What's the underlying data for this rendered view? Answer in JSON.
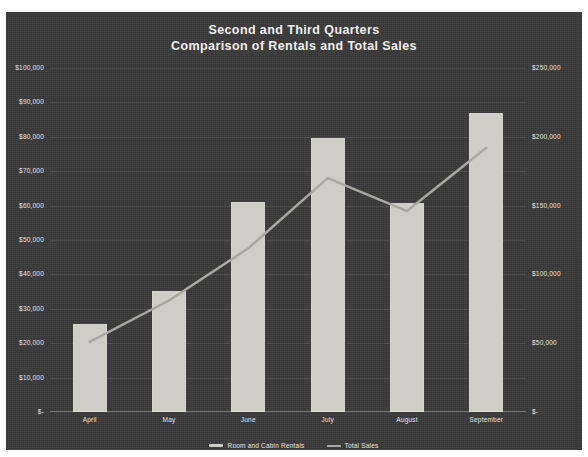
{
  "chart_data": {
    "type": "bar",
    "title": "Second and Third Quarters\nComparison of Rentals and Total Sales",
    "title_line1": "Second and Third Quarters",
    "title_line2": "Comparison of Rentals and Total Sales",
    "categories": [
      "April",
      "May",
      "June",
      "July",
      "August",
      "September"
    ],
    "series": [
      {
        "name": "Room and Cabin Rentals",
        "type": "bar",
        "axis": "left",
        "color": "#cfcdc8",
        "values": [
          25600,
          35200,
          61000,
          79600,
          60800,
          86900
        ]
      },
      {
        "name": "Total Sales",
        "type": "line",
        "axis": "right",
        "color": "#a9a7a2",
        "values": [
          51000,
          81000,
          119000,
          170000,
          146000,
          192000
        ]
      }
    ],
    "xlabel": "",
    "ylabel": "",
    "y_left": {
      "min": 0,
      "max": 100000,
      "step": 10000,
      "ticks": [
        "$100,000",
        "$90,000",
        "$80,000",
        "$70,000",
        "$60,000",
        "$50,000",
        "$40,000",
        "$30,000",
        "$20,000",
        "$10,000",
        "$-"
      ],
      "tick_values": [
        100000,
        90000,
        80000,
        70000,
        60000,
        50000,
        40000,
        30000,
        20000,
        10000,
        0
      ]
    },
    "y_right": {
      "min": 0,
      "max": 250000,
      "step": 50000,
      "ticks": [
        "$250,000",
        "$200,000",
        "$150,000",
        "$100,000",
        "$50,000",
        "$-"
      ],
      "tick_values": [
        250000,
        200000,
        150000,
        100000,
        50000,
        0
      ]
    },
    "grid": true,
    "legend_position": "bottom",
    "legend": [
      "Room and Cabin Rentals",
      "Total Sales"
    ],
    "background_color": "#3a3a3a",
    "text_color": "#e7e5e2"
  }
}
